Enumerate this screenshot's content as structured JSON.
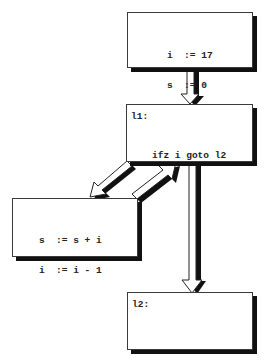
{
  "diagram": {
    "type": "control-flow-graph",
    "nodes": [
      {
        "id": "entry",
        "label": "",
        "lines": [
          "i  := 17",
          "s  := 0"
        ]
      },
      {
        "id": "l1",
        "label": "l1:",
        "lines": [
          "ifz i goto l2"
        ]
      },
      {
        "id": "body",
        "label": "",
        "lines": [
          "s  := s + i",
          "i  := i - 1"
        ]
      },
      {
        "id": "l2",
        "label": "l2:",
        "lines": []
      }
    ],
    "edges": [
      {
        "from": "entry",
        "to": "l1"
      },
      {
        "from": "l1",
        "to": "body"
      },
      {
        "from": "body",
        "to": "l1"
      },
      {
        "from": "l1",
        "to": "l2"
      }
    ],
    "colors": {
      "background": "#ffffff",
      "border": "#3a3a3a",
      "shadow": "#111111",
      "text": "#222222"
    }
  }
}
